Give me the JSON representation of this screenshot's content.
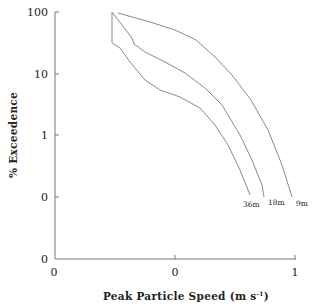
{
  "chart_data": {
    "type": "line",
    "title": "",
    "xlabel": "Peak Particle Speed (m s⁻¹)",
    "ylabel": "% Exceedence",
    "y_scale": "log",
    "x_tick_labels": [
      "0",
      "0",
      "1"
    ],
    "y_tick_labels": [
      "100",
      "10",
      "1",
      "0",
      "0"
    ],
    "grid": false,
    "legend": "inline labels at curve ends",
    "series": [
      {
        "name": "9m",
        "points_px": [
          [
            118,
            13
          ],
          [
            150,
            22
          ],
          [
            175,
            30
          ],
          [
            196,
            40
          ],
          [
            215,
            57
          ],
          [
            232,
            75
          ],
          [
            251,
            100
          ],
          [
            268,
            130
          ],
          [
            282,
            165
          ],
          [
            292,
            197
          ]
        ],
        "x_approx": [
          0.52,
          0.79,
          1.0,
          1.17,
          1.33,
          1.48,
          1.64,
          1.78,
          1.89,
          1.98
        ],
        "y_approx_pct": [
          100,
          71,
          53,
          37,
          19,
          10,
          4,
          1.3,
          0.36,
          0.1
        ]
      },
      {
        "name": "18m",
        "points_px": [
          [
            112,
            12
          ],
          [
            122,
            25
          ],
          [
            132,
            38
          ],
          [
            134,
            44
          ],
          [
            145,
            52
          ],
          [
            165,
            62
          ],
          [
            185,
            73
          ],
          [
            205,
            88
          ],
          [
            222,
            105
          ],
          [
            240,
            135
          ],
          [
            252,
            160
          ],
          [
            262,
            185
          ],
          [
            264,
            197
          ]
        ],
        "x_approx": [
          0.47,
          0.56,
          0.64,
          0.66,
          0.75,
          0.92,
          1.08,
          1.25,
          1.39,
          1.54,
          1.64,
          1.72,
          1.74
        ],
        "y_approx_pct": [
          100,
          62,
          38,
          30,
          22,
          15,
          10,
          6,
          3,
          1,
          0.39,
          0.16,
          0.1
        ]
      },
      {
        "name": "36m",
        "points_px": [
          [
            112,
            12
          ],
          [
            112,
            43
          ],
          [
            120,
            48
          ],
          [
            130,
            62
          ],
          [
            145,
            80
          ],
          [
            160,
            90
          ],
          [
            180,
            97
          ],
          [
            200,
            108
          ],
          [
            215,
            125
          ],
          [
            228,
            145
          ],
          [
            240,
            170
          ],
          [
            250,
            195
          ]
        ],
        "x_approx": [
          0.47,
          0.47,
          0.54,
          0.62,
          0.75,
          0.88,
          1.04,
          1.21,
          1.33,
          1.44,
          1.54,
          1.63
        ],
        "y_approx_pct": [
          100,
          31,
          26,
          15,
          8,
          5.5,
          4.2,
          2.8,
          1.5,
          0.7,
          0.28,
          0.11
        ]
      }
    ],
    "series_labels": [
      "36m",
      "18m",
      "9m"
    ]
  },
  "axes": {
    "x_title": "Peak Particle Speed (m s",
    "x_title_sup": "-1",
    "x_title_close": ")",
    "y_title": "% Exceedence",
    "x_ticks": [
      "0",
      "0",
      "1"
    ],
    "y_ticks": [
      "100",
      "10",
      "1",
      "0",
      "0"
    ]
  },
  "colors": {
    "curve": "#8a8a8a",
    "axis": "#777777",
    "text": "#222222",
    "background": "#ffffff"
  }
}
